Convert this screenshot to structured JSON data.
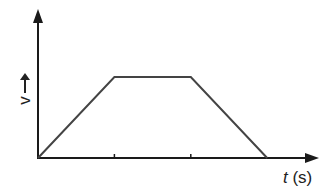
{
  "chart_data": {
    "type": "line",
    "title": "",
    "xlabel": "t (s)",
    "xlabel_parts": {
      "var": "t",
      "unit": " (s)"
    },
    "ylabel": "v",
    "ylabel_arrow": "→",
    "x": [
      0,
      1,
      2,
      3
    ],
    "series": [
      {
        "name": "velocity",
        "values": [
          0,
          1,
          1,
          0
        ]
      }
    ],
    "xticks": [
      1,
      2
    ],
    "xtick_labels": [],
    "ytick_labels": [],
    "xlim": [
      0,
      3.68
    ],
    "ylim": [
      0,
      1.83
    ],
    "grid": false,
    "legend": null,
    "colors": {
      "axis": "#1a1a1a",
      "line": "#444444"
    }
  },
  "labels": {
    "x_var": "t",
    "x_unit": " (s)",
    "y_var": "v"
  }
}
